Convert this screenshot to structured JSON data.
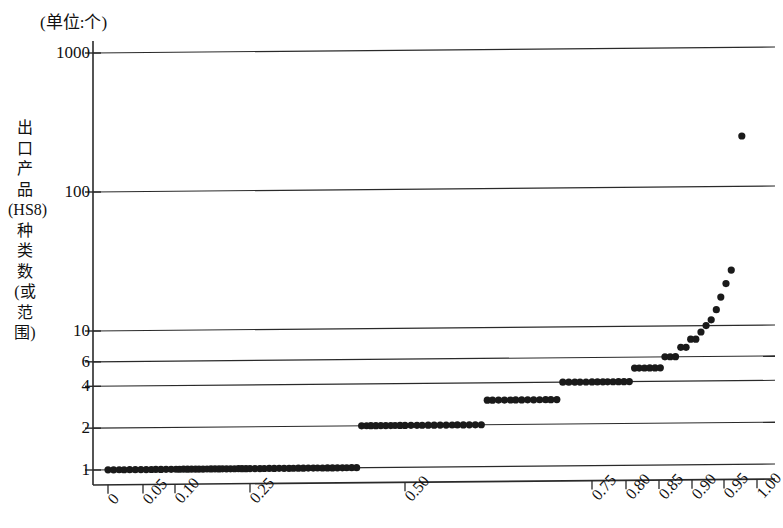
{
  "chart_data": {
    "type": "scatter",
    "title": "",
    "subtitle": "",
    "unit_note": "(单位:个)",
    "ylabel": "出口产品(HS8)种类数(或范围)",
    "ylabel_chars": [
      "出",
      "口",
      "产",
      "品",
      "(HS8)",
      "种",
      "类",
      "数",
      "(或",
      "范",
      "围)"
    ],
    "xlabel": "",
    "yscale": "log",
    "ylim": [
      1,
      1000
    ],
    "ytick_labels": [
      "1000",
      "100",
      "10",
      "6",
      "4",
      "2",
      "1"
    ],
    "ytick_values": [
      1000,
      100,
      10,
      6,
      4,
      2,
      1
    ],
    "grid": "horizontal",
    "legend": "none",
    "xscale": "percentile",
    "xtick_labels": [
      "0",
      "0.05",
      "0.10",
      "0.25",
      "0.50",
      "0.75",
      "0.80",
      "0.85",
      "0.90",
      "0.95",
      "1.00"
    ],
    "xtick_values": [
      0,
      0.05,
      0.1,
      0.25,
      0.5,
      0.75,
      0.8,
      0.85,
      0.9,
      0.95,
      1.0
    ],
    "xlim": [
      0,
      1.0
    ],
    "marker": "filled-circle",
    "marker_color": "#1a1a1a",
    "marker_size": 5,
    "series": [
      {
        "name": "出口产品种类数分布",
        "x": [
          0.0,
          0.008,
          0.016,
          0.023,
          0.031,
          0.039,
          0.047,
          0.055,
          0.063,
          0.07,
          0.078,
          0.086,
          0.094,
          0.102,
          0.109,
          0.117,
          0.125,
          0.133,
          0.141,
          0.148,
          0.156,
          0.164,
          0.172,
          0.18,
          0.188,
          0.195,
          0.203,
          0.211,
          0.219,
          0.227,
          0.234,
          0.242,
          0.25,
          0.258,
          0.266,
          0.273,
          0.281,
          0.289,
          0.297,
          0.305,
          0.313,
          0.32,
          0.328,
          0.336,
          0.344,
          0.352,
          0.359,
          0.367,
          0.375,
          0.383,
          0.391,
          0.399,
          0.406,
          0.414,
          0.422,
          0.43,
          0.438,
          0.445,
          0.453,
          0.461,
          0.469,
          0.477,
          0.484,
          0.492,
          0.5,
          0.508,
          0.516,
          0.523,
          0.531,
          0.539,
          0.547,
          0.555,
          0.563,
          0.57,
          0.578,
          0.586,
          0.594,
          0.602,
          0.61,
          0.617,
          0.625,
          0.633,
          0.641,
          0.648,
          0.656,
          0.664,
          0.672,
          0.68,
          0.688,
          0.695,
          0.703,
          0.711,
          0.719,
          0.727,
          0.734,
          0.742,
          0.75,
          0.758,
          0.766,
          0.773,
          0.781,
          0.789,
          0.797,
          0.805,
          0.813,
          0.82,
          0.828,
          0.836,
          0.844,
          0.852,
          0.859,
          0.867,
          0.875,
          0.883,
          0.891,
          0.898,
          0.906,
          0.914,
          0.922,
          0.93,
          0.938,
          0.945,
          0.953,
          0.961,
          0.977
        ],
        "y": [
          1,
          1,
          1,
          1,
          1,
          1,
          1,
          1,
          1,
          1,
          1,
          1,
          1,
          1,
          1,
          1,
          1,
          1,
          1,
          1,
          1,
          1,
          1,
          1,
          1,
          1,
          1,
          1,
          1,
          1,
          1,
          1,
          1,
          1,
          1,
          1,
          1,
          1,
          1,
          1,
          1,
          1,
          1,
          1,
          1,
          1,
          1,
          1,
          1,
          1,
          1,
          1,
          1,
          1,
          1,
          2,
          2,
          2,
          2,
          2,
          2,
          2,
          2,
          2,
          2,
          2,
          2,
          2,
          2,
          2,
          2,
          2,
          2,
          2,
          2,
          2,
          2,
          2,
          3,
          3,
          3,
          3,
          3,
          3,
          3,
          3,
          3,
          3,
          3,
          3,
          3,
          4,
          4,
          4,
          4,
          4,
          4,
          4,
          4,
          4,
          4,
          4,
          4,
          4,
          5,
          5,
          5,
          5,
          5,
          5,
          6,
          6,
          6,
          7,
          7,
          8,
          8,
          9,
          10,
          11,
          13,
          16,
          20,
          25,
          230
        ]
      }
    ],
    "annotations": [
      {
        "text": "(单位:个)",
        "position": "top-left-of-axis"
      }
    ]
  },
  "axis": {
    "y_axis_name": "y-axis",
    "x_axis_name": "x-axis"
  }
}
